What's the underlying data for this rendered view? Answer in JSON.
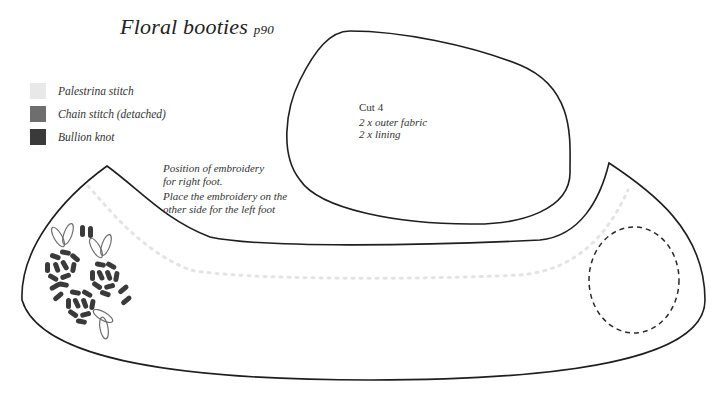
{
  "title": {
    "main": "Floral booties",
    "page_ref": "p90"
  },
  "legend": {
    "items": [
      {
        "label": "Palestrina stitch",
        "color": "#e8e8e8"
      },
      {
        "label": "Chain stitch (detached)",
        "color": "#6e6e6e"
      },
      {
        "label": "Bullion knot",
        "color": "#3a3a3a"
      }
    ]
  },
  "sole_piece": {
    "heading": "Cut 4",
    "line1": "2 x outer fabric",
    "line2": "2 x lining"
  },
  "upper_piece": {
    "embroidery_note_1a": "Position of embroidery",
    "embroidery_note_1b": "for right foot.",
    "embroidery_note_2a": "Place the embroidery on the",
    "embroidery_note_2b": "other side for the left foot"
  },
  "colors": {
    "outline": "#1e1e1e",
    "palestrina": "#e4e4e4",
    "bullion": "#3a3a3a",
    "chain": "#6e6e6e",
    "placement_circle": "#2a2a2a"
  }
}
